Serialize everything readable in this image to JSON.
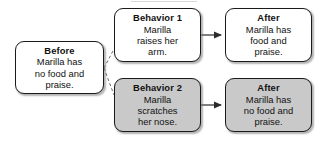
{
  "diagram": {
    "type": "flow-diagram",
    "title_visible": false,
    "colors": {
      "box_white_fill": "#ffffff",
      "box_gray_fill": "#c9c9c9",
      "border": "#1a1a1a",
      "text": "#111111",
      "connector": "#4a4a4a"
    },
    "nodes": [
      {
        "id": "before",
        "title": "Before",
        "body": [
          "Marilla has",
          "no food and",
          "praise."
        ],
        "fill": "white",
        "x": 15,
        "y": 41,
        "w": 89,
        "h": 53
      },
      {
        "id": "behavior-1",
        "title": "Behavior 1",
        "body": [
          "Marilla",
          "raises her",
          "arm."
        ],
        "fill": "white",
        "x": 114,
        "y": 8,
        "w": 87,
        "h": 54
      },
      {
        "id": "after-1",
        "title": "After",
        "body": [
          "Marilla has",
          "food and",
          "praise."
        ],
        "fill": "white",
        "x": 225,
        "y": 8,
        "w": 87,
        "h": 54
      },
      {
        "id": "behavior-2",
        "title": "Behavior 2",
        "body": [
          "Marilla",
          "scratches",
          "her nose."
        ],
        "fill": "gray",
        "x": 114,
        "y": 78,
        "w": 87,
        "h": 54
      },
      {
        "id": "after-2",
        "title": "After",
        "body": [
          "Marilla has",
          "no food and",
          "praise."
        ],
        "fill": "gray",
        "x": 225,
        "y": 78,
        "w": 87,
        "h": 54
      }
    ],
    "connectors": [
      {
        "id": "before-to-behavior-1",
        "from": "before",
        "to": "behavior-1",
        "style": "dashed",
        "arrowhead": false
      },
      {
        "id": "before-to-behavior-2",
        "from": "before",
        "to": "behavior-2",
        "style": "dashed",
        "arrowhead": false
      },
      {
        "id": "behavior-1-to-after-1",
        "from": "behavior-1",
        "to": "after-1",
        "style": "solid",
        "arrowhead": true
      },
      {
        "id": "behavior-2-to-after-2",
        "from": "behavior-2",
        "to": "after-2",
        "style": "solid",
        "arrowhead": true
      }
    ]
  }
}
